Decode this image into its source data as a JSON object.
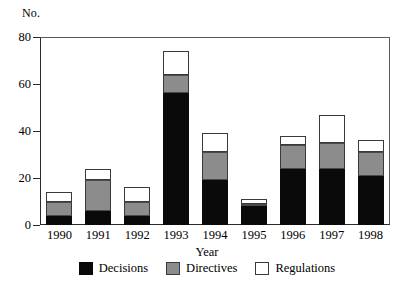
{
  "chart_data": {
    "type": "bar",
    "subtype": "stacked-vertical",
    "title": "",
    "xlabel": "Year",
    "ylabel": "No.",
    "categories": [
      "1990",
      "1991",
      "1992",
      "1993",
      "1994",
      "1995",
      "1996",
      "1997",
      "1998"
    ],
    "series": [
      {
        "name": "Decisions",
        "color": "#0a0a0a",
        "values": [
          4,
          6,
          4,
          56,
          19,
          8,
          24,
          24,
          21
        ]
      },
      {
        "name": "Directives",
        "color": "#8c8c8c",
        "values": [
          6,
          13,
          6,
          8,
          12,
          1,
          10,
          11,
          10
        ]
      },
      {
        "name": "Regulations",
        "color": "#ffffff",
        "values": [
          4,
          5,
          6,
          10,
          8,
          2,
          4,
          12,
          5
        ]
      }
    ],
    "totals": [
      14,
      24,
      16,
      74,
      39,
      11,
      38,
      47,
      36
    ],
    "ylim": [
      0,
      80
    ],
    "yticks": [
      0,
      20,
      40,
      60,
      80
    ],
    "ytick_labels": [
      "0",
      "20",
      "40",
      "60",
      "80"
    ],
    "grid": false,
    "legend_position": "bottom"
  },
  "axes": {
    "y_name": "No.",
    "x_name": "Year"
  },
  "legend": {
    "items": [
      {
        "label": "Decisions",
        "swatch": "black-square-swatch"
      },
      {
        "label": "Directives",
        "swatch": "gray-square-swatch"
      },
      {
        "label": "Regulations",
        "swatch": "white-square-swatch"
      }
    ]
  }
}
